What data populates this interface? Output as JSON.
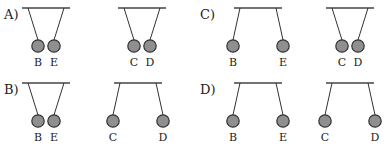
{
  "options": [
    {
      "label": "A)",
      "pairs": [
        {
          "left": {
            "name": "B",
            "deflection": "inward"
          },
          "right": {
            "name": "E",
            "deflection": "inward"
          },
          "state": "attract"
        },
        {
          "left": {
            "name": "C",
            "deflection": "inward"
          },
          "right": {
            "name": "D",
            "deflection": "inward"
          },
          "state": "attract"
        }
      ]
    },
    {
      "label": "B)",
      "pairs": [
        {
          "left": {
            "name": "B",
            "deflection": "inward"
          },
          "right": {
            "name": "E",
            "deflection": "inward"
          },
          "state": "attract"
        },
        {
          "left": {
            "name": "C",
            "deflection": "outward"
          },
          "right": {
            "name": "D",
            "deflection": "outward"
          },
          "state": "repel"
        }
      ]
    },
    {
      "label": "C)",
      "pairs": [
        {
          "left": {
            "name": "B",
            "deflection": "outward"
          },
          "right": {
            "name": "E",
            "deflection": "outward"
          },
          "state": "repel"
        },
        {
          "left": {
            "name": "C",
            "deflection": "inward"
          },
          "right": {
            "name": "D",
            "deflection": "inward"
          },
          "state": "attract"
        }
      ]
    },
    {
      "label": "D)",
      "pairs": [
        {
          "left": {
            "name": "B",
            "deflection": "outward"
          },
          "right": {
            "name": "E",
            "deflection": "outward"
          },
          "state": "repel"
        },
        {
          "left": {
            "name": "C",
            "deflection": "outward"
          },
          "right": {
            "name": "D",
            "deflection": "outward"
          },
          "state": "repel"
        }
      ]
    }
  ],
  "colors": {
    "ball_fill": "#8f8f8f",
    "line": "#333333"
  }
}
